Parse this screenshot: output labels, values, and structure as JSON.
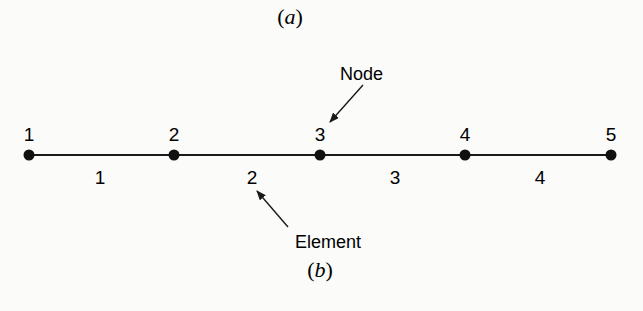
{
  "figure": {
    "part_a_label": "a",
    "part_b_label": "b"
  },
  "mesh": {
    "line_color": "#1a1a1a",
    "nodes": [
      {
        "label": "1",
        "x": 29
      },
      {
        "label": "2",
        "x": 174
      },
      {
        "label": "3",
        "x": 320
      },
      {
        "label": "4",
        "x": 465
      },
      {
        "label": "5",
        "x": 611
      }
    ],
    "elements": [
      {
        "label": "1",
        "x": 100
      },
      {
        "label": "2",
        "x": 252
      },
      {
        "label": "3",
        "x": 395
      },
      {
        "label": "4",
        "x": 540
      }
    ]
  },
  "callouts": {
    "node": "Node",
    "element": "Element"
  }
}
